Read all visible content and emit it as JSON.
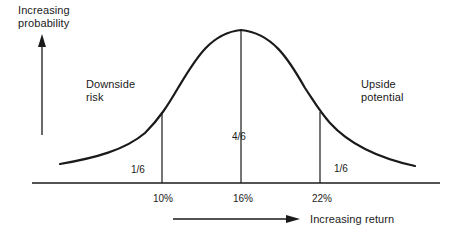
{
  "diagram": {
    "type": "normal-distribution",
    "y_axis_label": [
      "Increasing",
      "probability"
    ],
    "x_axis_label": "Increasing return",
    "regions": {
      "left": {
        "label": [
          "Downside",
          "risk"
        ],
        "fraction": "1/6"
      },
      "center": {
        "fraction": "4/6"
      },
      "right": {
        "label": [
          "Upside",
          "potential"
        ],
        "fraction": "1/6"
      }
    },
    "ticks": [
      "10%",
      "16%",
      "22%"
    ],
    "colors": {
      "line": "#1a1a1a",
      "background": "#ffffff"
    }
  }
}
